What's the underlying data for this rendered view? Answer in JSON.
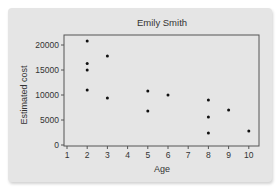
{
  "chart_data": {
    "type": "scatter",
    "title": "Emily Smith",
    "xlabel": "Age",
    "ylabel": "Estimated cost",
    "xlim": [
      1,
      10
    ],
    "ylim": [
      0,
      22000
    ],
    "xticks": [
      1,
      2,
      3,
      4,
      5,
      6,
      7,
      8,
      9,
      10
    ],
    "yticks": [
      0,
      5000,
      10000,
      15000,
      20000
    ],
    "grid": false,
    "legend": null,
    "points": [
      {
        "x": 2,
        "y": 20800
      },
      {
        "x": 2,
        "y": 16300
      },
      {
        "x": 2,
        "y": 15000
      },
      {
        "x": 2,
        "y": 11000
      },
      {
        "x": 3,
        "y": 17800
      },
      {
        "x": 3,
        "y": 9400
      },
      {
        "x": 5,
        "y": 10800
      },
      {
        "x": 5,
        "y": 6800
      },
      {
        "x": 6,
        "y": 10000
      },
      {
        "x": 8,
        "y": 9000
      },
      {
        "x": 8,
        "y": 5600
      },
      {
        "x": 8,
        "y": 2400
      },
      {
        "x": 9,
        "y": 7000
      },
      {
        "x": 10,
        "y": 2800
      }
    ]
  },
  "colors": {
    "panel": "#e5e5e5",
    "axis": "#555555",
    "point": "#111111"
  }
}
